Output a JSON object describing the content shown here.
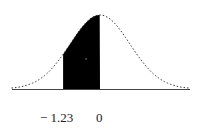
{
  "chart_data": {
    "type": "area",
    "title": "",
    "xlabel": "",
    "ylabel": "",
    "curve": "standard normal density",
    "shaded_region": {
      "from": -1.23,
      "to": 0
    },
    "tick_labels": [
      "− 1.23",
      "0"
    ],
    "ticks": [
      -1.23,
      0
    ],
    "shaded_area_probability": 0.3907,
    "grid": false,
    "legend": null
  },
  "labels": {
    "left": "− 1.23",
    "right": "0"
  },
  "colors": {
    "shade": "#000000",
    "curve": "#333333",
    "axis": "#444444"
  }
}
